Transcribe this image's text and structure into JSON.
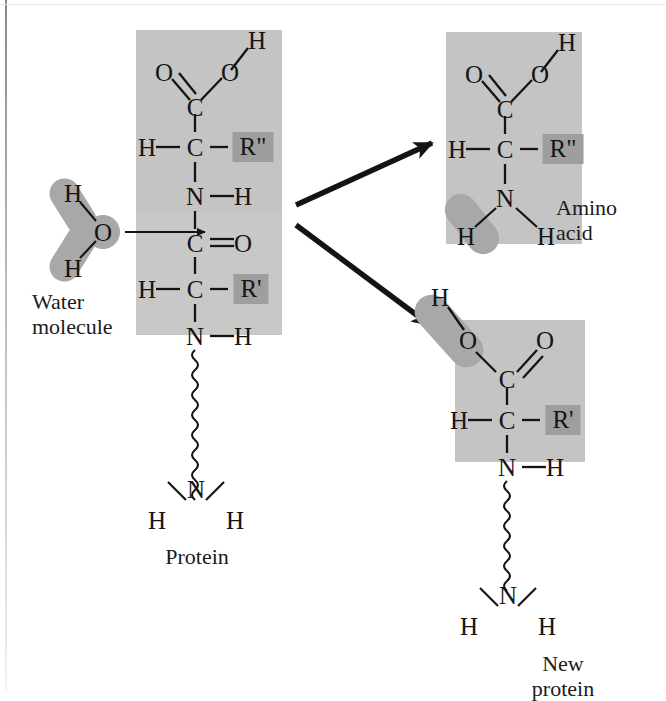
{
  "figure": {
    "title_implicit": "Protein hydrolysis diagram",
    "background": "#ffffff",
    "highlight_box_color": "#c4c4c4",
    "rgroup_box_color": "#9e9e9e",
    "blob_color": "#a8a8a8",
    "line_color": "#141414"
  },
  "captions": {
    "water": "Water\nmolecule",
    "protein": "Protein",
    "amino_acid": "Amino\nacid",
    "new_protein": "New protein"
  },
  "water_molecule": {
    "h_top": "H",
    "o": "O",
    "h_bottom": "H"
  },
  "protein": {
    "residue_top": {
      "h_hydroxyl": "H",
      "o_double": "O",
      "o_single": "O",
      "c_carbonyl": "C",
      "h_alpha": "H",
      "c_alpha": "C",
      "r_group": "R\"",
      "n": "N",
      "h_amide": "H"
    },
    "residue_bottom": {
      "c_carbonyl": "C",
      "o_double": "O",
      "h_alpha": "H",
      "c_alpha": "C",
      "r_group": "R'",
      "n": "N",
      "h_amide": "H"
    },
    "terminus": {
      "n": "N",
      "h_left": "H",
      "h_right": "H"
    }
  },
  "amino_acid_product": {
    "h_hydroxyl": "H",
    "o_double": "O",
    "o_single": "O",
    "c_carbonyl": "C",
    "h_alpha": "H",
    "c_alpha": "C",
    "r_group": "R\"",
    "n": "N",
    "h_added": "H",
    "h_amine": "H"
  },
  "new_protein_product": {
    "h_added": "H",
    "o_hydroxyl": "O",
    "o_double": "O",
    "c_carbonyl": "C",
    "h_alpha": "H",
    "c_alpha": "C",
    "r_group": "R'",
    "n": "N",
    "h_amide": "H",
    "terminus": {
      "n": "N",
      "h_left": "H",
      "h_right": "H"
    }
  }
}
